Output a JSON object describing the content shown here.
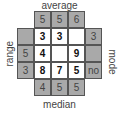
{
  "labels": {
    "top": "average",
    "bottom": "median",
    "left": "range",
    "right": "mode"
  },
  "colors": {
    "clue_cell": "#a9a9a9",
    "grid_cell": "#ffffff",
    "border": "#555555"
  },
  "top_clues": [
    "5",
    "5",
    "6"
  ],
  "bottom_clues": [
    "4",
    "5",
    "5"
  ],
  "left_clues": [
    "",
    "5",
    "3"
  ],
  "right_clues": [
    "3",
    "",
    "no"
  ],
  "grid": [
    [
      "3",
      "3",
      ""
    ],
    [
      "4",
      "",
      "9"
    ],
    [
      "8",
      "7",
      "5"
    ]
  ]
}
